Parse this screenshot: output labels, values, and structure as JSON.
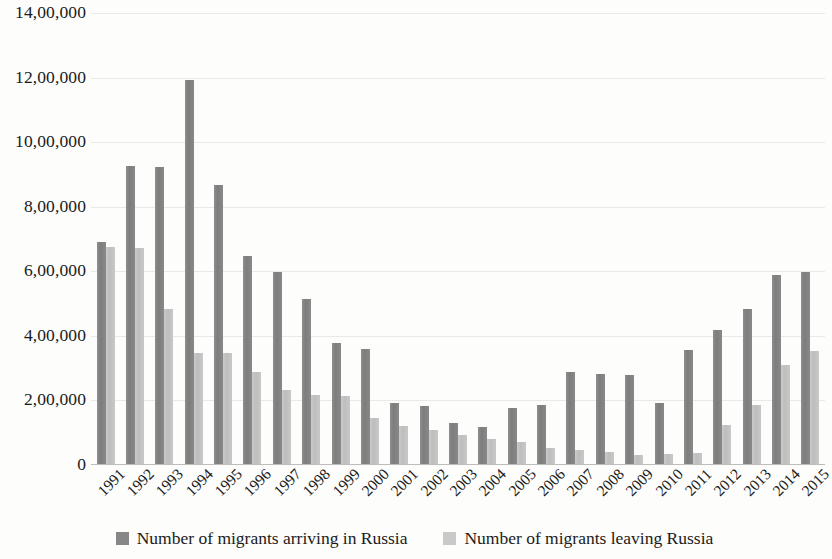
{
  "chart_data": {
    "type": "bar",
    "title": "",
    "subtitle": "",
    "xlabel": "",
    "ylabel": "",
    "grid": true,
    "legend_position": "bottom",
    "ylim": [
      0,
      1400000
    ],
    "ytick_labels": [
      "14,00,000",
      "12,00,000",
      "10,00,000",
      "8,00,000",
      "6,00,000",
      "4,00,000",
      "2,00,000",
      "0"
    ],
    "ytick_values": [
      1400000,
      1200000,
      1000000,
      800000,
      600000,
      400000,
      200000,
      0
    ],
    "categories": [
      "1991",
      "1992",
      "1993",
      "1994",
      "1995",
      "1996",
      "1997",
      "1998",
      "1999",
      "2000",
      "2001",
      "2002",
      "2003",
      "2004",
      "2005",
      "2006",
      "2007",
      "2008",
      "2009",
      "2010",
      "2011",
      "2012",
      "2013",
      "2014",
      "2015"
    ],
    "series": [
      {
        "name": "Number of migrants arriving in Russia",
        "color": "#808080",
        "values": [
          690000,
          925000,
          923000,
          1191000,
          866000,
          647000,
          597000,
          513000,
          379000,
          359000,
          193000,
          184000,
          129000,
          119000,
          177000,
          186000,
          287000,
          282000,
          280000,
          191000,
          357000,
          417000,
          482000,
          590000,
          598000
        ]
      },
      {
        "name": "Number of migrants leaving Russia",
        "color": "#c3c3c3",
        "values": [
          675000,
          673000,
          483000,
          346000,
          347000,
          288000,
          233000,
          216000,
          215000,
          146000,
          121000,
          107000,
          94000,
          80000,
          70000,
          54000,
          47000,
          39000,
          32000,
          33000,
          37000,
          123000,
          186000,
          311000,
          353000
        ]
      }
    ]
  },
  "legend": {
    "items": [
      {
        "label": "Number of migrants arriving in Russia",
        "swatch": "legend-swatch-arriving"
      },
      {
        "label": "Number of migrants leaving Russia",
        "swatch": "legend-swatch-leaving"
      }
    ]
  }
}
